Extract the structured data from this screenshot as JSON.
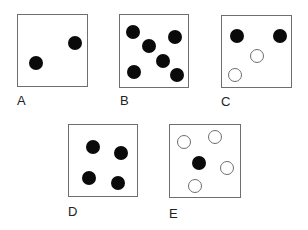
{
  "figure": {
    "panels": [
      {
        "label": "A",
        "box": {
          "x": 17,
          "y": 14,
          "w": 71,
          "h": 73
        },
        "label_pos": {
          "x": 17,
          "y": 94
        },
        "dots": [
          {
            "x": 75,
            "y": 43,
            "fill": "filled"
          },
          {
            "x": 36,
            "y": 63,
            "fill": "filled"
          }
        ]
      },
      {
        "label": "B",
        "box": {
          "x": 119,
          "y": 14,
          "w": 70,
          "h": 74
        },
        "label_pos": {
          "x": 120,
          "y": 94
        },
        "dots": [
          {
            "x": 133,
            "y": 32,
            "fill": "filled"
          },
          {
            "x": 175,
            "y": 37,
            "fill": "filled"
          },
          {
            "x": 149,
            "y": 46,
            "fill": "filled"
          },
          {
            "x": 163,
            "y": 61,
            "fill": "filled"
          },
          {
            "x": 134,
            "y": 72,
            "fill": "filled"
          },
          {
            "x": 177,
            "y": 75,
            "fill": "filled"
          }
        ]
      },
      {
        "label": "C",
        "box": {
          "x": 221,
          "y": 15,
          "w": 71,
          "h": 73
        },
        "label_pos": {
          "x": 221,
          "y": 95
        },
        "dots": [
          {
            "x": 237,
            "y": 36,
            "fill": "filled"
          },
          {
            "x": 280,
            "y": 36,
            "fill": "filled"
          },
          {
            "x": 257,
            "y": 56,
            "fill": "open"
          },
          {
            "x": 235,
            "y": 75,
            "fill": "open"
          }
        ]
      },
      {
        "label": "D",
        "box": {
          "x": 68,
          "y": 124,
          "w": 70,
          "h": 73
        },
        "label_pos": {
          "x": 68,
          "y": 205
        },
        "dots": [
          {
            "x": 93,
            "y": 147,
            "fill": "filled"
          },
          {
            "x": 121,
            "y": 153,
            "fill": "filled"
          },
          {
            "x": 89,
            "y": 178,
            "fill": "filled"
          },
          {
            "x": 118,
            "y": 183,
            "fill": "filled"
          }
        ]
      },
      {
        "label": "E",
        "box": {
          "x": 169,
          "y": 124,
          "w": 72,
          "h": 74
        },
        "label_pos": {
          "x": 169,
          "y": 207
        },
        "dots": [
          {
            "x": 184,
            "y": 142,
            "fill": "open"
          },
          {
            "x": 215,
            "y": 137,
            "fill": "open"
          },
          {
            "x": 199,
            "y": 163,
            "fill": "filled"
          },
          {
            "x": 227,
            "y": 168,
            "fill": "open"
          },
          {
            "x": 195,
            "y": 186,
            "fill": "open"
          }
        ]
      }
    ],
    "colors": {
      "filled_dot": "#0a0a0a",
      "open_dot_stroke": "#6e6e6e",
      "box_border": "#6e6e6e",
      "label": "#222222"
    }
  }
}
